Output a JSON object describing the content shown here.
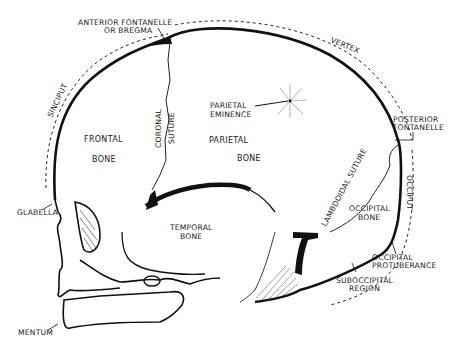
{
  "diagram": {
    "type": "anatomical",
    "colors": {
      "ink": "#111111",
      "background": "#ffffff"
    },
    "labels": {
      "anterior_fontanelle_1": "ANTERIOR FONTANELLE",
      "anterior_fontanelle_2": "OR BREGMA",
      "vertex": "VERTEX",
      "sinciput": "SINCIPUT",
      "frontal_1": "FRONTAL",
      "frontal_2": "BONE",
      "coronal_1": "CORONAL",
      "coronal_2": "SUTURE",
      "parietal_eminence_1": "PARIETAL",
      "parietal_eminence_2": "EMINENCE",
      "parietal_1": "PARIETAL",
      "parietal_2": "BONE",
      "posterior_fontanelle_1": "POSTERIOR",
      "posterior_fontanelle_2": "FONTANELLE",
      "glabella": "GLABELLA",
      "temporal_1": "TEMPORAL",
      "temporal_2": "BONE",
      "lambdoidal": "LAMBDOIDAL SUTURE",
      "occiput": "OCCIPUT",
      "occipital_1": "OCCIPITAL",
      "occipital_2": "BONE",
      "occipital_protuberance_1": "OCCIPITAL",
      "occipital_protuberance_2": "PROTUBERANCE",
      "suboccipital_1": "SUBOCCIPITAL",
      "suboccipital_2": "REGION",
      "mentum": "MENTUM"
    }
  }
}
